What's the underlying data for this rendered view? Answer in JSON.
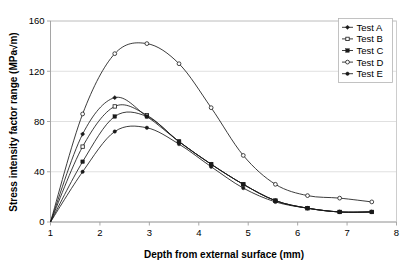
{
  "chart_data": {
    "type": "line",
    "title": "",
    "xlabel": "Depth from external surface (mm)",
    "ylabel": "Stress intensity factor range (MPa√m)",
    "xlim": [
      1,
      8
    ],
    "ylim": [
      0,
      160
    ],
    "xticks": [
      "1",
      "2",
      "3",
      "4",
      "5",
      "6",
      "7",
      "8"
    ],
    "yticks": [
      "0",
      "40",
      "80",
      "120",
      "160"
    ],
    "grid": "horizontal",
    "legend_position": "top-right",
    "series": [
      {
        "name": "Test A",
        "marker": "diamond",
        "x": [
          1.0,
          1.65,
          2.3,
          2.95,
          3.6,
          4.25,
          4.9,
          5.55,
          6.2,
          6.85,
          7.5
        ],
        "y": [
          0,
          70,
          99,
          84,
          64,
          46,
          30,
          17,
          11,
          8,
          8
        ]
      },
      {
        "name": "Test B",
        "marker": "square",
        "x": [
          1.0,
          1.65,
          2.3,
          2.95,
          3.6,
          4.25,
          4.9,
          5.55,
          6.2,
          6.85,
          7.5
        ],
        "y": [
          0,
          60,
          92,
          85,
          64,
          46,
          30,
          17,
          11,
          8,
          8
        ]
      },
      {
        "name": "Test C",
        "marker": "square-filled",
        "x": [
          1.0,
          1.65,
          2.3,
          2.95,
          3.6,
          4.25,
          4.9,
          5.55,
          6.2,
          6.85,
          7.5
        ],
        "y": [
          0,
          48,
          84,
          84,
          64,
          46,
          30,
          17,
          11,
          8,
          8
        ]
      },
      {
        "name": "Test D",
        "marker": "circle-open",
        "x": [
          1.0,
          1.65,
          2.3,
          2.95,
          3.6,
          4.25,
          4.9,
          5.55,
          6.2,
          6.85,
          7.5
        ],
        "y": [
          0,
          86,
          134,
          142,
          126,
          91,
          53,
          30,
          21,
          19,
          16
        ]
      },
      {
        "name": "Test E",
        "marker": "circle-filled",
        "x": [
          1.0,
          1.65,
          2.3,
          2.95,
          3.6,
          4.25,
          4.9,
          5.55,
          6.2,
          6.85,
          7.5
        ],
        "y": [
          0,
          40,
          72,
          75,
          62,
          44,
          27,
          16,
          11,
          8,
          8
        ]
      }
    ]
  },
  "legend": {
    "items": [
      {
        "label": "Test A"
      },
      {
        "label": "Test B"
      },
      {
        "label": "Test C"
      },
      {
        "label": "Test D"
      },
      {
        "label": "Test E"
      }
    ]
  },
  "colors": {
    "series": "#1a1a1a",
    "grid": "#d8d8d8",
    "axis": "#a0a0a0",
    "background": "#ffffff"
  }
}
